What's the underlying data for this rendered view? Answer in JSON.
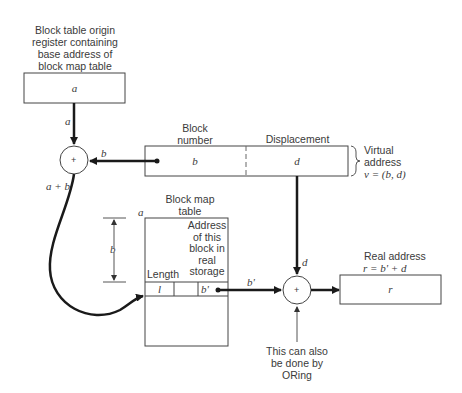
{
  "diagram": {
    "origin_register": {
      "caption_lines": [
        "Block table origin",
        "register containing",
        "base address of",
        "block map table"
      ],
      "value": "a"
    },
    "adder1": {
      "symbol": "+",
      "input_top_label": "a",
      "input_right_label": "b",
      "output_label": "a + b"
    },
    "virtual_address": {
      "field1_header": "Block\nnumber",
      "field1_header_lines": [
        "Block",
        "number"
      ],
      "field1_value": "b",
      "field2_header": "Displacement",
      "field2_value": "d",
      "brace_label_lines": [
        "Virtual",
        "address"
      ],
      "formula": "v = (b, d)"
    },
    "block_map_table": {
      "caption_lines": [
        "Block map",
        "table"
      ],
      "origin_label": "a",
      "offset_label": "b",
      "column_length": "Length",
      "column_address_lines": [
        "Address",
        "of this",
        "block in",
        "real",
        "storage"
      ],
      "row_length_value": "l",
      "row_address_value": "b'"
    },
    "adder2": {
      "symbol": "+",
      "input_left_label": "b'",
      "input_top_label": "d",
      "note_lines": [
        "This can also",
        "be done by",
        "ORing"
      ]
    },
    "real_address": {
      "caption": "Real address",
      "formula": "r = b' + d",
      "value": "r"
    }
  },
  "colors": {
    "line": "#1a1a1a",
    "thin": "#555555",
    "text": "#3a3a3a",
    "background": "#ffffff"
  }
}
